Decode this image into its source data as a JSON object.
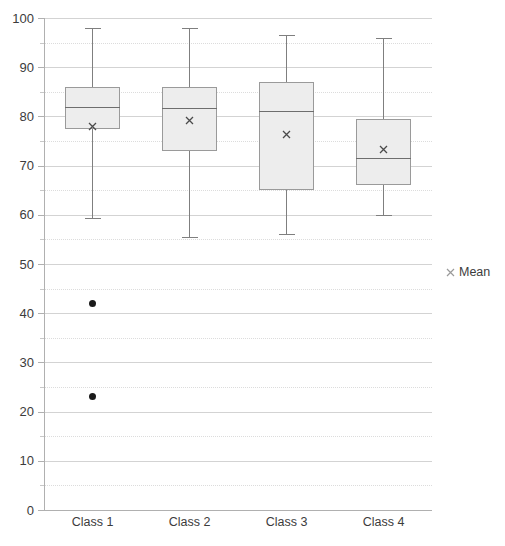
{
  "chart_data": {
    "type": "box",
    "title": "",
    "xlabel": "",
    "ylabel": "",
    "ylim": [
      0,
      100
    ],
    "y_major_step": 10,
    "y_minor_step": 5,
    "grid": true,
    "grid_major": true,
    "grid_minor": true,
    "legend_position": "right",
    "categories": [
      "Class 1",
      "Class 2",
      "Class 3",
      "Class 4"
    ],
    "y_tick_labels": [
      "0",
      "10",
      "20",
      "30",
      "40",
      "50",
      "60",
      "70",
      "80",
      "90",
      "100"
    ],
    "y_tick_values": [
      0,
      10,
      20,
      30,
      40,
      50,
      60,
      70,
      80,
      90,
      100
    ],
    "y_minor_tick_values": [
      5,
      15,
      25,
      35,
      45,
      55,
      65,
      75,
      85,
      95
    ],
    "legend": [
      {
        "label": "Mean",
        "marker": "cross-marker",
        "color": "#9a9a9a"
      }
    ],
    "series": [
      {
        "name": "Class 1",
        "whisker_low": 59.3,
        "q1": 77.5,
        "median": 82.0,
        "q3": 86.0,
        "whisker_high": 98.0,
        "mean": 78.0,
        "outliers": [
          42.0,
          23.0
        ]
      },
      {
        "name": "Class 2",
        "whisker_low": 55.5,
        "q1": 73.0,
        "median": 81.8,
        "q3": 86.0,
        "whisker_high": 98.0,
        "mean": 79.2,
        "outliers": []
      },
      {
        "name": "Class 3",
        "whisker_low": 56.0,
        "q1": 65.0,
        "median": 81.0,
        "q3": 87.0,
        "whisker_high": 96.5,
        "mean": 76.3,
        "outliers": []
      },
      {
        "name": "Class 4",
        "whisker_low": 60.0,
        "q1": 66.0,
        "median": 71.5,
        "q3": 79.5,
        "whisker_high": 96.0,
        "mean": 73.3,
        "outliers": []
      }
    ],
    "colors": {
      "box_fill": "#ededed",
      "box_border": "#9a9a9a",
      "whisker": "#7f7f7f",
      "median": "#6e6e6e",
      "mean_marker": "#4a4a4a",
      "outlier": "#1a1a1a",
      "gridline_major": "#d3d3d3",
      "gridline_minor": "#dcdcdc",
      "axis": "#b0b0b0",
      "text": "#3c3c3c"
    }
  }
}
